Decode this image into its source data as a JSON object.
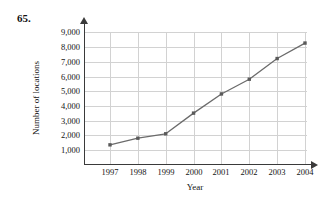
{
  "problem": {
    "number": "65."
  },
  "chart_data": {
    "type": "line",
    "title": "",
    "subtitle": "",
    "xlabel": "Year",
    "ylabel": "Number of locations",
    "categories": [
      "1997",
      "1998",
      "1999",
      "2000",
      "2001",
      "2002",
      "2003",
      "2004"
    ],
    "x": [
      1997,
      1998,
      1999,
      2000,
      2001,
      2002,
      2003,
      2004
    ],
    "values": [
      1350,
      1800,
      2100,
      3500,
      4800,
      5800,
      7200,
      8250
    ],
    "series": [
      {
        "name": "Number of locations",
        "values": [
          1350,
          1800,
          2100,
          3500,
          4800,
          5800,
          7200,
          8250
        ]
      }
    ],
    "y_tick_labels": [
      "1,000",
      "2,000",
      "3,000",
      "4,000",
      "5,000",
      "6,000",
      "7,000",
      "8,000",
      "9,000"
    ],
    "y_ticks": [
      1000,
      2000,
      3000,
      4000,
      5000,
      6000,
      7000,
      8000,
      9000
    ],
    "x_tick_labels": [
      "1997",
      "1998",
      "1999",
      "2000",
      "2001",
      "2002",
      "2003",
      "2004"
    ],
    "ylim": [
      0,
      9000
    ],
    "xlim": [
      1997,
      2004
    ],
    "grid": true,
    "legend": false,
    "legend_position": "none",
    "marker": "square",
    "line_color": "#6b6b6b",
    "marker_color": "#5a5a5a",
    "grid_color": "#d2d2d2",
    "axis_color": "#3a3a3a"
  }
}
